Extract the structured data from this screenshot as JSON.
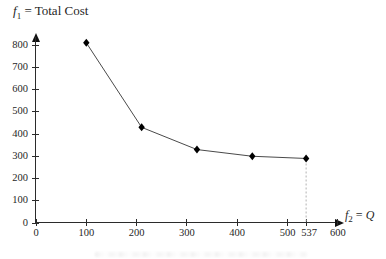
{
  "figure": {
    "y_axis_title": {
      "f": "f",
      "sub": "1",
      "rest": " = Total Cost"
    },
    "x_axis_title": {
      "f": "f",
      "sub": "2",
      "eq": " = ",
      "value": "Q"
    }
  },
  "chart_data": {
    "type": "line",
    "ylabel": "f1 = Total Cost",
    "xlabel": "f2 = Q",
    "series": [
      {
        "name": "Total Cost",
        "x": [
          100,
          210,
          320,
          430,
          537
        ],
        "y": [
          810,
          430,
          330,
          300,
          290
        ]
      }
    ],
    "x_ticks": [
      0,
      100,
      200,
      300,
      400,
      500,
      600
    ],
    "extra_x_tick": 537,
    "y_ticks": [
      0,
      100,
      200,
      300,
      400,
      500,
      600,
      700,
      800
    ],
    "xlim": [
      0,
      620
    ],
    "ylim": [
      0,
      860
    ],
    "grid": false,
    "legend": null,
    "marker": "diamond",
    "annotations": [
      {
        "type": "vline-dashed",
        "x": 537,
        "from_y": 290,
        "to_y": 0
      }
    ],
    "colors": {
      "line": "#4a4a4a",
      "marker": "#000000",
      "axis": "#2b2b2b",
      "text": "#1f1f1f",
      "dashed": "#b3b3b3",
      "background": "#ffffff"
    }
  }
}
